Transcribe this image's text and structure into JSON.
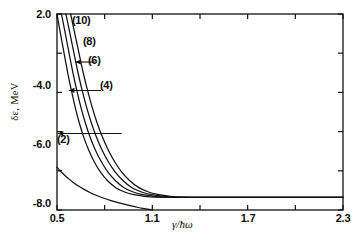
{
  "figure": {
    "title": "",
    "ylabel": "δε, MeV",
    "xlabel": "γ/ħω"
  },
  "chart_data": {
    "type": "line",
    "title": "",
    "xlabel": "γ/ħω",
    "ylabel": "δε, MeV",
    "xlim": [
      0.5,
      2.3
    ],
    "ylim": [
      -8.0,
      2.0
    ],
    "grid": false,
    "legend_position": "inline-annotations",
    "xticks": [
      0.5,
      0.8,
      1.1,
      1.4,
      1.7,
      2.0,
      2.3
    ],
    "xtick_labels": [
      "0.5",
      "",
      "1.1",
      "",
      "1.7",
      "",
      "2.3"
    ],
    "yticks": [
      2.0,
      0.0,
      -2.0,
      -4.0,
      -6.0,
      -8.0
    ],
    "ytick_labels": [
      "2.0",
      "",
      "",
      "-4.0",
      "-6.0",
      "-8.0"
    ],
    "plateau_value": -7.35,
    "annotations": [
      {
        "text": "(10)",
        "x": 0.63,
        "y": 1.55,
        "arrow": false
      },
      {
        "text": "(8)",
        "x": 0.75,
        "y": -0.45,
        "arrow": true,
        "arrow_to_x": 0.615
      },
      {
        "text": "(6)",
        "x": 0.79,
        "y": -1.9,
        "arrow": true,
        "arrow_to_x": 0.575
      },
      {
        "text": "(4)",
        "x": 0.92,
        "y": -4.1,
        "arrow": true,
        "arrow_to_x": 0.505
      },
      {
        "text": "(2)",
        "x": 0.525,
        "y": -5.65,
        "arrow": false
      }
    ],
    "series": [
      {
        "name": "(2)",
        "points": [
          [
            0.5,
            -5.82
          ],
          [
            0.52,
            -6.0
          ],
          [
            0.545,
            -6.2
          ],
          [
            0.57,
            -6.38
          ],
          [
            0.6,
            -6.58
          ],
          [
            0.635,
            -6.78
          ],
          [
            0.67,
            -6.95
          ],
          [
            0.71,
            -7.12
          ],
          [
            0.75,
            -7.26
          ],
          [
            0.795,
            -7.4
          ],
          [
            0.84,
            -7.52
          ],
          [
            0.89,
            -7.64
          ],
          [
            0.94,
            -7.74
          ],
          [
            0.99,
            -7.83
          ],
          [
            1.04,
            -7.92
          ],
          [
            1.1,
            -8.0
          ]
        ]
      },
      {
        "name": "(4)",
        "points": [
          [
            0.5,
            2.0
          ],
          [
            0.515,
            1.3
          ],
          [
            0.532,
            0.55
          ],
          [
            0.55,
            -0.25
          ],
          [
            0.57,
            -1.1
          ],
          [
            0.592,
            -1.95
          ],
          [
            0.615,
            -2.78
          ],
          [
            0.64,
            -3.55
          ],
          [
            0.668,
            -4.28
          ],
          [
            0.7,
            -4.95
          ],
          [
            0.735,
            -5.55
          ],
          [
            0.775,
            -6.08
          ],
          [
            0.82,
            -6.52
          ],
          [
            0.87,
            -6.86
          ],
          [
            0.925,
            -7.08
          ],
          [
            0.985,
            -7.22
          ],
          [
            1.05,
            -7.3
          ],
          [
            1.12,
            -7.34
          ],
          [
            1.2,
            -7.35
          ],
          [
            1.3,
            -7.35
          ],
          [
            2.3,
            -7.35
          ]
        ]
      },
      {
        "name": "(6)",
        "points": [
          [
            0.528,
            2.0
          ],
          [
            0.545,
            1.3
          ],
          [
            0.563,
            0.55
          ],
          [
            0.582,
            -0.25
          ],
          [
            0.603,
            -1.1
          ],
          [
            0.626,
            -1.95
          ],
          [
            0.651,
            -2.78
          ],
          [
            0.678,
            -3.55
          ],
          [
            0.708,
            -4.28
          ],
          [
            0.742,
            -4.95
          ],
          [
            0.78,
            -5.55
          ],
          [
            0.822,
            -6.08
          ],
          [
            0.87,
            -6.52
          ],
          [
            0.922,
            -6.86
          ],
          [
            0.98,
            -7.08
          ],
          [
            1.042,
            -7.22
          ],
          [
            1.11,
            -7.3
          ],
          [
            1.185,
            -7.34
          ],
          [
            1.27,
            -7.35
          ],
          [
            1.4,
            -7.35
          ],
          [
            2.3,
            -7.35
          ]
        ]
      },
      {
        "name": "(8)",
        "points": [
          [
            0.556,
            2.0
          ],
          [
            0.574,
            1.3
          ],
          [
            0.593,
            0.55
          ],
          [
            0.613,
            -0.25
          ],
          [
            0.635,
            -1.1
          ],
          [
            0.66,
            -1.95
          ],
          [
            0.687,
            -2.78
          ],
          [
            0.716,
            -3.55
          ],
          [
            0.748,
            -4.28
          ],
          [
            0.784,
            -4.95
          ],
          [
            0.824,
            -5.55
          ],
          [
            0.868,
            -6.08
          ],
          [
            0.918,
            -6.52
          ],
          [
            0.972,
            -6.86
          ],
          [
            1.032,
            -7.08
          ],
          [
            1.096,
            -7.22
          ],
          [
            1.166,
            -7.3
          ],
          [
            1.242,
            -7.34
          ],
          [
            1.33,
            -7.35
          ],
          [
            1.46,
            -7.35
          ],
          [
            2.3,
            -7.35
          ]
        ]
      },
      {
        "name": "(10)",
        "points": [
          [
            0.586,
            2.0
          ],
          [
            0.604,
            1.3
          ],
          [
            0.624,
            0.55
          ],
          [
            0.645,
            -0.25
          ],
          [
            0.668,
            -1.1
          ],
          [
            0.694,
            -1.95
          ],
          [
            0.722,
            -2.78
          ],
          [
            0.752,
            -3.55
          ],
          [
            0.786,
            -4.28
          ],
          [
            0.823,
            -4.95
          ],
          [
            0.864,
            -5.55
          ],
          [
            0.909,
            -6.08
          ],
          [
            0.96,
            -6.52
          ],
          [
            1.015,
            -6.86
          ],
          [
            1.076,
            -7.08
          ],
          [
            1.141,
            -7.22
          ],
          [
            1.212,
            -7.3
          ],
          [
            1.29,
            -7.34
          ],
          [
            1.38,
            -7.35
          ],
          [
            1.51,
            -7.35
          ],
          [
            2.3,
            -7.35
          ]
        ]
      }
    ]
  },
  "axes_pixels": {
    "left": 57,
    "right": 343,
    "top": 14,
    "bottom": 210
  },
  "ytick_labels_render": [
    {
      "text": "2.0",
      "top": 8
    },
    {
      "text": "-4.0",
      "top": 79
    },
    {
      "text": "-6.0",
      "top": 138
    },
    {
      "text": "-8.0",
      "top": 197
    }
  ],
  "xtick_labels_render": [
    {
      "text": "0.5",
      "left": 57
    },
    {
      "text": "1.1",
      "left": 152
    },
    {
      "text": "1.7",
      "left": 248
    },
    {
      "text": "2.3",
      "left": 343
    }
  ],
  "curve_labels_render": [
    {
      "text": "(10)",
      "left": 72,
      "top": 14
    },
    {
      "text": "(8)",
      "left": 83,
      "top": 35
    },
    {
      "text": "(6)",
      "left": 88,
      "top": 54
    },
    {
      "text": "(4)",
      "left": 100,
      "top": 79
    },
    {
      "text": "(2)",
      "left": 57,
      "top": 133
    }
  ]
}
